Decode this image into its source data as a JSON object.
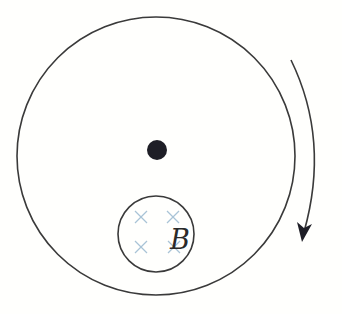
{
  "diagram": {
    "type": "physics-rotating-disk",
    "outer_disk": {
      "cx": 156,
      "cy": 156,
      "r": 139,
      "stroke": "#3a3a3a"
    },
    "center_axis": {
      "cx": 157,
      "cy": 150,
      "r": 10,
      "fill": "#1e1e26"
    },
    "field_region": {
      "cx": 156,
      "cy": 234,
      "r": 38,
      "stroke": "#3a3a3a",
      "label": "B",
      "cross_color": "#a9c3d6",
      "crosses": [
        {
          "x": 141,
          "y": 217
        },
        {
          "x": 173,
          "y": 217
        },
        {
          "x": 141,
          "y": 247
        },
        {
          "x": 174,
          "y": 247
        }
      ]
    },
    "rotation_arrow": {
      "direction": "clockwise",
      "stroke": "#3a3a3a"
    }
  }
}
